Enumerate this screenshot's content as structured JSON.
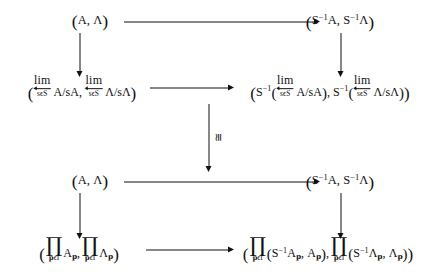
{
  "figure": {
    "kind": "commutative-diagram",
    "rows": 4,
    "columns": 2,
    "background_color": "#ffffff",
    "ink_color": "#111111"
  },
  "nodes": {
    "r1c1": {
      "id": "node-r1c1",
      "text": "(A, Λ)",
      "parts": {
        "open": "(",
        "first": "A",
        "comma": ",",
        "second": "Λ",
        "close": ")"
      }
    },
    "r1c2": {
      "id": "node-r1c2",
      "text": "(S⁻¹A, S⁻¹Λ)",
      "parts": {
        "open": "(",
        "s": "S",
        "exp": "−1",
        "first": "A",
        "comma": ",",
        "s2": "S",
        "exp2": "−1",
        "second": "Λ",
        "close": ")"
      }
    },
    "r2c1": {
      "id": "node-r2c1",
      "text": "(lim← A/sA, lim← Λ/sΛ)",
      "parts": {
        "open": "(",
        "lim": "lim",
        "index": "s ϵ S",
        "arg1": "A/sA",
        "comma": ",",
        "lim2": "lim",
        "index2": "s ϵ S",
        "arg2": "Λ/sΛ",
        "close": ")"
      }
    },
    "r2c2": {
      "id": "node-r2c2",
      "text": "(S⁻¹(lim← A/sA), S⁻¹(lim← Λ/sΛ))",
      "parts": {
        "open": "(",
        "s": "S",
        "exp": "−1",
        "inner_open": "(",
        "lim": "lim",
        "index": "s ϵ S",
        "arg1": "A/sA",
        "inner_close": ")",
        "comma": ",",
        "s2": "S",
        "exp2": "−1",
        "inner_open2": "(",
        "lim2": "lim",
        "index2": "s ϵ S",
        "arg2": "Λ/sΛ",
        "inner_close2": ")",
        "close": ")"
      }
    },
    "r3c1": {
      "id": "node-r3c1",
      "text": "(A, Λ)",
      "parts": {
        "open": "(",
        "first": "A",
        "comma": ",",
        "second": "Λ",
        "close": ")"
      }
    },
    "r3c2": {
      "id": "node-r3c2",
      "text": "(S⁻¹A, S⁻¹Λ)",
      "parts": {
        "open": "(",
        "s": "S",
        "exp": "−1",
        "first": "A",
        "comma": ",",
        "s2": "S",
        "exp2": "−1",
        "second": "Λ",
        "close": ")"
      }
    },
    "r4c1": {
      "id": "node-r4c1",
      "text": "(∏ₚ∈I A𝔭, ∏ₚ∈I Λ𝔭)",
      "parts": {
        "open": "(",
        "prod": "∏",
        "index": "ϵ I",
        "index_var": "𝔭",
        "arg1": "A",
        "arg1_sub": "𝔭",
        "comma": ",",
        "prod2": "∏",
        "index2": "ϵ I",
        "index_var2": "𝔭",
        "arg2": "Λ",
        "arg2_sub": "𝔭",
        "close": ")"
      }
    },
    "r4c2": {
      "id": "node-r4c2",
      "text": "(∏ₚ∈I (S⁻¹A𝔭, A𝔭), ∏ₚ∈I (S⁻¹Λ𝔭, Λ𝔭))",
      "parts": {
        "open": "(",
        "prod": "∏",
        "index": "ϵ I",
        "index_var": "𝔭",
        "pair_open": "(",
        "s": "S",
        "exp": "−1",
        "a": "A",
        "a_sub": "𝔭",
        "pair_comma": ",",
        "b": "A",
        "b_sub": "𝔭",
        "pair_close": ")",
        "comma": ",",
        "prod2": "∏",
        "index2": "ϵ I",
        "index_var2": "𝔭",
        "pair_open2": "(",
        "s2": "S",
        "exp2": "−1",
        "a2": "Λ",
        "a2_sub": "𝔭",
        "pair_comma2": ",",
        "b2": "Λ",
        "b2_sub": "𝔭",
        "pair_close2": ")",
        "close": ")"
      }
    }
  },
  "arrows": {
    "h1": {
      "id": "arrow-top-horizontal",
      "from": "r1c1",
      "to": "r1c2",
      "direction": "right",
      "label": ""
    },
    "h2": {
      "id": "arrow-row2-horizontal",
      "from": "r2c1",
      "to": "r2c2",
      "direction": "right",
      "label": ""
    },
    "h3": {
      "id": "arrow-row3-horizontal",
      "from": "r3c1",
      "to": "r3c2",
      "direction": "right",
      "label": ""
    },
    "h4": {
      "id": "arrow-bottom-horizontal",
      "from": "r4c1",
      "to": "r4c2",
      "direction": "right",
      "label": ""
    },
    "v_left_12": {
      "id": "arrow-left-r1-r2",
      "from": "r1c1",
      "to": "r2c1",
      "direction": "down",
      "label": ""
    },
    "v_right_12": {
      "id": "arrow-right-r1-r2",
      "from": "r1c2",
      "to": "r2c2",
      "direction": "down",
      "label": ""
    },
    "v_mid_23": {
      "id": "arrow-middle-iso",
      "from": "r2",
      "to": "r3",
      "direction": "down",
      "label": "≅",
      "label_orientation": "rotated-90"
    },
    "v_left_34": {
      "id": "arrow-left-r3-r4",
      "from": "r3c1",
      "to": "r4c1",
      "direction": "down",
      "label": ""
    },
    "v_right_34": {
      "id": "arrow-right-r3-r4",
      "from": "r3c2",
      "to": "r4c2",
      "direction": "down",
      "label": ""
    }
  },
  "labels": {
    "iso": "≅",
    "limit_index": "s ϵ S",
    "product_index_var": "𝔭",
    "product_index_rest": "ϵ I",
    "lim": "lim",
    "prod": "∏"
  }
}
